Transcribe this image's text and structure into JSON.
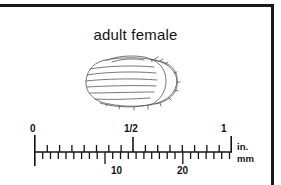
{
  "figure": {
    "caption": "adult female",
    "specimen": "engorged-tick-dorsal-view"
  },
  "scale_bar": {
    "inch_labels": [
      {
        "text": "0",
        "value": 0
      },
      {
        "text": "1/2",
        "value": 0.5
      },
      {
        "text": "1",
        "value": 1
      }
    ],
    "mm_labels": [
      {
        "text": "10",
        "value": 10
      },
      {
        "text": "20",
        "value": 20
      }
    ],
    "unit_top": "in.",
    "unit_bottom": "mm",
    "inch_range": [
      0,
      1
    ],
    "mm_range": [
      0,
      25.4
    ],
    "inch_minor_divisions": 16,
    "mm_minor_divisions": 25
  },
  "colors": {
    "ink": "#131313",
    "frame": "#1a1a1a",
    "artwork_line": "#4a4a4a",
    "background": "#ffffff"
  }
}
